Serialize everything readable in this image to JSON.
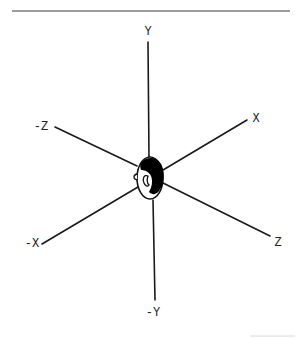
{
  "diagram": {
    "title": "",
    "type": "3D coordinate axes with head orientation",
    "colors": {
      "line": "#1a1a1a",
      "label": "#222222",
      "rule": "#3a3a3a",
      "faint_rule": "#d8d8d8",
      "hair_fill": "#000000",
      "background": "#ffffff"
    },
    "center": {
      "x": 150,
      "y": 178
    },
    "head": {
      "cx": 150,
      "cy": 178,
      "rx": 13,
      "ry": 21
    },
    "axes": [
      {
        "id": "pos-y",
        "label": "Y",
        "x1": 148,
        "y1": 42,
        "x2": 149,
        "y2": 158,
        "label_x": 148,
        "label_y": 35
      },
      {
        "id": "neg-y",
        "label": "-Y",
        "x1": 153,
        "y1": 200,
        "x2": 155,
        "y2": 300,
        "label_x": 153,
        "label_y": 316
      },
      {
        "id": "pos-x",
        "label": "X",
        "x1": 163,
        "y1": 170,
        "x2": 247,
        "y2": 120,
        "label_x": 256,
        "label_y": 122
      },
      {
        "id": "neg-x",
        "label": "-X",
        "x1": 138,
        "y1": 187,
        "x2": 42,
        "y2": 244,
        "label_x": 32,
        "label_y": 247
      },
      {
        "id": "pos-z",
        "label": "Z",
        "x1": 163,
        "y1": 183,
        "x2": 270,
        "y2": 236,
        "label_x": 278,
        "label_y": 246
      },
      {
        "id": "neg-z",
        "label": "-Z",
        "x1": 137,
        "y1": 166,
        "x2": 55,
        "y2": 127,
        "label_x": 41,
        "label_y": 130
      }
    ],
    "top_rule": {
      "x1": 12,
      "y1": 11,
      "x2": 290,
      "y2": 11
    },
    "bottom_rule": {
      "x1": 250,
      "y1": 336,
      "x2": 295,
      "y2": 336
    }
  }
}
